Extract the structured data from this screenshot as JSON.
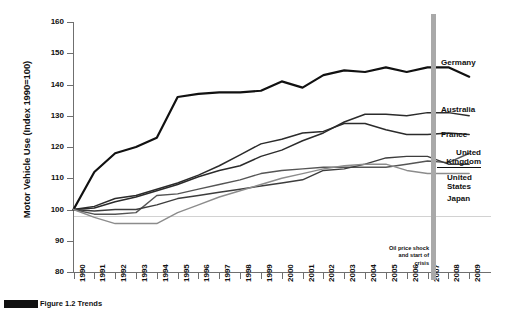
{
  "figure": {
    "caption_fragment": "Figure 1.2 Trends"
  },
  "annotation": {
    "crisis_line_1": "Oil price shock",
    "crisis_line_2": "and start of",
    "crisis_line_3": "crisis",
    "crisis_year": 2007
  },
  "chart_data": {
    "type": "line",
    "title": "",
    "xlabel": "",
    "ylabel": "Motor Vehicle Use (Index 1990=100)",
    "ylim": [
      80,
      160
    ],
    "ytick_labels": [
      "80",
      "90",
      "100",
      "110",
      "120",
      "130",
      "140",
      "150",
      "160"
    ],
    "yticks": [
      80,
      90,
      100,
      110,
      120,
      130,
      140,
      150,
      160
    ],
    "grid": "horizontal-line-at-100",
    "legend_position": "right-of-plot",
    "x": [
      1990,
      1991,
      1992,
      1993,
      1994,
      1995,
      1996,
      1997,
      1998,
      1999,
      2000,
      2001,
      2002,
      2003,
      2004,
      2005,
      2006,
      2007,
      2008,
      2009
    ],
    "xtick_labels": [
      "1990",
      "1991",
      "1992",
      "1993",
      "1994",
      "1995",
      "1996",
      "1997",
      "1998",
      "1999",
      "2000",
      "2001",
      "2002",
      "2003",
      "2004",
      "2005",
      "2006",
      "2007",
      "2008",
      "2009"
    ],
    "series": [
      {
        "name": "Germany",
        "color": "#111111",
        "width": 2.2,
        "values": [
          100,
          112,
          118,
          120,
          123,
          136,
          137,
          137.5,
          137.5,
          138,
          141,
          139,
          143,
          144.5,
          144,
          145.5,
          144,
          145.5,
          145.5,
          142.5
        ]
      },
      {
        "name": "Australia",
        "color": "#2b2b2b",
        "width": 1.5,
        "values": [
          100,
          100.5,
          102.5,
          104,
          106,
          108,
          110.5,
          112.5,
          114,
          117,
          119,
          122,
          124.5,
          128,
          130.5,
          130.5,
          130,
          131,
          131,
          130
        ]
      },
      {
        "name": "France",
        "color": "#2b2b2b",
        "width": 1.5,
        "values": [
          100,
          101,
          103.5,
          104.5,
          106.5,
          108.5,
          111,
          114,
          117.5,
          121,
          122.5,
          124.5,
          125,
          127.5,
          127.5,
          125.5,
          124,
          124,
          124.5,
          124
        ]
      },
      {
        "name": "United Kingdom",
        "color": "#555555",
        "width": 1.4,
        "values": [
          100,
          98.5,
          98.5,
          99,
          104.5,
          105,
          106.5,
          108,
          109.5,
          111.5,
          112.5,
          113,
          113.5,
          113.5,
          113.5,
          113.5,
          114.5,
          115.5,
          115,
          118
        ]
      },
      {
        "name": "United States",
        "color": "#3d3d3d",
        "width": 1.4,
        "values": [
          100,
          99.5,
          100,
          100,
          101.5,
          103.5,
          104.5,
          105.5,
          106.5,
          107.5,
          108.5,
          109.5,
          112.5,
          113,
          114.5,
          116.5,
          117,
          117,
          114.5,
          114.5
        ]
      },
      {
        "name": "Japan",
        "color": "#8c8c8c",
        "width": 1.4,
        "values": [
          100,
          97.5,
          95.5,
          95.5,
          95.5,
          99,
          101.5,
          104,
          106,
          108,
          110,
          111.5,
          113,
          114,
          114.5,
          114.5,
          112.5,
          111.5,
          111.5,
          111.5
        ]
      }
    ],
    "series_label_positions": [
      {
        "name": "Germany",
        "x": 441,
        "y": 58
      },
      {
        "name": "Australia",
        "x": 441,
        "y": 105
      },
      {
        "name": "France",
        "x": 441,
        "y": 130
      },
      {
        "name": "United Kingdom",
        "x": 441,
        "y": 148
      },
      {
        "name": "United States",
        "x": 441,
        "y": 173
      },
      {
        "name": "Japan",
        "x": 441,
        "y": 194
      }
    ]
  }
}
